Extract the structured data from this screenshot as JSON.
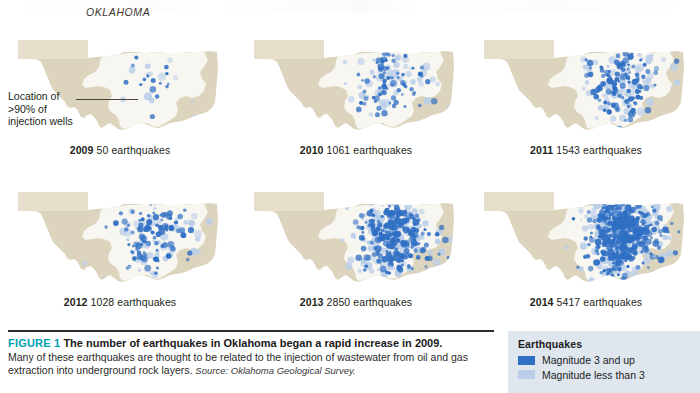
{
  "figure": {
    "state_title": "OKLAHOMA",
    "label": "FIGURE 1",
    "headline": " The number of earthquakes in Oklahoma began a rapid increase in 2009.",
    "body": "Many of these earthquakes are thought to be related to the injection of wastewater from oil and gas extraction into underground rock layers. ",
    "source": "Source: Oklahoma Geological Survey."
  },
  "annotation": {
    "text": "Location of >90% of injection wells"
  },
  "legend": {
    "title": "Earthquakes",
    "items": [
      {
        "label": "Magnitude 3 and up",
        "color": "#2f6fc4"
      },
      {
        "label": "Magnitude less than 3",
        "color": "#bacee9"
      }
    ],
    "background": "#dfe6ee"
  },
  "colors": {
    "state_fill": "#ddd4bd",
    "panhandle_fill": "#e6dfcb",
    "well_region_fill": "#f8f6f0",
    "accent_teal": "#00a0b4",
    "quake_dark": "#2f6fc4",
    "quake_light": "#bacee9"
  },
  "chart_data": {
    "type": "map",
    "title": "The number of earthquakes in Oklahoma began a rapid increase in 2009.",
    "region": "Oklahoma",
    "unit": "earthquakes per year",
    "categories": [
      "2009",
      "2010",
      "2011",
      "2012",
      "2013",
      "2014"
    ],
    "values": [
      50,
      1061,
      1543,
      1028,
      2850,
      5417
    ],
    "series": [
      {
        "name": "Earthquakes per year",
        "values": [
          50,
          1061,
          1543,
          1028,
          2850,
          5417
        ]
      }
    ],
    "legend": {
      "position": "bottom-right",
      "entries": [
        "Magnitude 3 and up",
        "Magnitude less than 3"
      ]
    },
    "source": "Oklahoma Geological Survey"
  },
  "panels": [
    {
      "id": "p2009",
      "year": "2009",
      "count": "50",
      "text": " 50 earthquakes",
      "density": 0.012,
      "dense_count": 14,
      "sparse_count": 10,
      "seed": 11
    },
    {
      "id": "p2010",
      "year": "2010",
      "count": "1061",
      "text": " 1061 earthquakes",
      "density": 0.19,
      "dense_count": 70,
      "sparse_count": 48,
      "seed": 23
    },
    {
      "id": "p2011",
      "year": "2011",
      "count": "1543",
      "text": " 1543 earthquakes",
      "density": 0.28,
      "dense_count": 105,
      "sparse_count": 70,
      "seed": 37
    },
    {
      "id": "p2012",
      "year": "2012",
      "count": "1028",
      "text": " 1028 earthquakes",
      "density": 0.19,
      "dense_count": 92,
      "sparse_count": 60,
      "seed": 53
    },
    {
      "id": "p2013",
      "year": "2013",
      "count": "2850",
      "text": " 2850 earthquakes",
      "density": 0.52,
      "dense_count": 210,
      "sparse_count": 140,
      "seed": 71
    },
    {
      "id": "p2014",
      "year": "2014",
      "count": "5417",
      "text": " 5417 earthquakes",
      "density": 1.0,
      "dense_count": 340,
      "sparse_count": 200,
      "seed": 97
    }
  ]
}
